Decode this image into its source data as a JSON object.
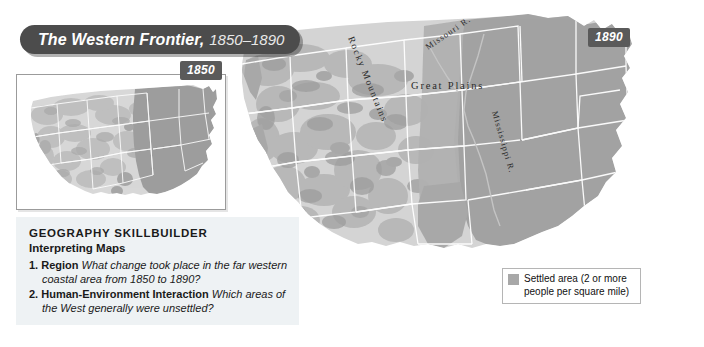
{
  "title_banner": {
    "main": "The Western Frontier,",
    "years": "1850–1890"
  },
  "year_badges": {
    "inset": "1850",
    "main": "1890"
  },
  "skillbuilder": {
    "title": "GEOGRAPHY SKILLBUILDER",
    "subtitle": "Interpreting Maps",
    "questions": [
      {
        "number": "1.",
        "term": "Region",
        "question": "What change took place in the far western coastal area from 1850 to 1890?"
      },
      {
        "number": "2.",
        "term": "Human-Environment Interaction",
        "question": "Which areas of the West generally were unsettled?"
      }
    ]
  },
  "legend": {
    "swatch_color": "#a8a8a8",
    "line1": "Settled area (2 or more",
    "line2": "people per square mile)",
    "full_text": "Settled area (2 or more people per square mile)"
  },
  "map_labels": {
    "rocky_mountains": "Rocky Mountains",
    "great_plains": "Great Plains",
    "missouri_river": "Missouri R.",
    "mississippi_river": "Mississippi R."
  },
  "colors": {
    "banner_bg": "#4c4c4c",
    "badge_bg": "#5a5a5a",
    "skillbuilder_bg": "#eef2f4",
    "settled_fill": "#a8a8a8",
    "unsettled_fill": "#d6d6d6",
    "terrain_dark": "#9a9a9a",
    "state_border": "#ffffff"
  },
  "bottom_caption": ""
}
